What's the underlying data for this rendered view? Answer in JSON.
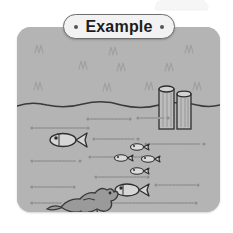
{
  "page": {
    "background_color": "#ffffff",
    "width": 233,
    "height": 233
  },
  "title_badge": {
    "label": "Example",
    "left_dot": "•",
    "right_dot": "•",
    "background_color": "#f2f2f2",
    "border_color": "#6e6e6e",
    "text_color": "#1c1c1c"
  },
  "scene": {
    "name": "underwater-ocean-illustration",
    "panel_color": "#b4b4b4",
    "line_color": "#4a4a4a",
    "sky": {
      "label": "sky-region",
      "bird_marks": [
        {
          "x": 18,
          "y": 18,
          "size": 8
        },
        {
          "x": 62,
          "y": 34,
          "size": 8
        },
        {
          "x": 17,
          "y": 55,
          "size": 9
        },
        {
          "x": 92,
          "y": 20,
          "size": 7
        },
        {
          "x": 100,
          "y": 36,
          "size": 8
        },
        {
          "x": 86,
          "y": 56,
          "size": 8
        },
        {
          "x": 128,
          "y": 55,
          "size": 8
        },
        {
          "x": 148,
          "y": 36,
          "size": 8
        },
        {
          "x": 168,
          "y": 18,
          "size": 8
        },
        {
          "x": 176,
          "y": 55,
          "size": 8
        }
      ]
    },
    "water_surface": {
      "label": "water-surface-line",
      "y": 77
    },
    "pilings": {
      "label": "wooden-pilings",
      "count": 2,
      "items": [
        {
          "x": 142,
          "y": 60,
          "width": 15,
          "height": 42
        },
        {
          "x": 160,
          "y": 64,
          "width": 14,
          "height": 36
        }
      ]
    },
    "currents": {
      "label": "underwater-current-lines",
      "items": [
        {
          "x1": 72,
          "y": 92,
          "x2": 112
        },
        {
          "x1": 122,
          "y": 91,
          "x2": 150
        },
        {
          "x1": 16,
          "y": 101,
          "x2": 70
        },
        {
          "x1": 78,
          "y": 112,
          "x2": 120
        },
        {
          "x1": 130,
          "y": 117,
          "x2": 186
        },
        {
          "x1": 16,
          "y": 134,
          "x2": 62
        },
        {
          "x1": 74,
          "y": 130,
          "x2": 124
        },
        {
          "x1": 80,
          "y": 150,
          "x2": 130
        },
        {
          "x1": 16,
          "y": 160,
          "x2": 56
        },
        {
          "x1": 140,
          "y": 158,
          "x2": 180
        },
        {
          "x1": 16,
          "y": 176,
          "x2": 48
        },
        {
          "x1": 86,
          "y": 176,
          "x2": 178
        }
      ]
    },
    "fish": {
      "label": "fish-group",
      "large_fish": [
        {
          "name": "fish-left-upper",
          "x": 45,
          "y": 113,
          "length": 26,
          "direction": "left"
        },
        {
          "name": "fish-bottom-center",
          "x": 110,
          "y": 163,
          "length": 24,
          "direction": "left"
        }
      ],
      "school": [
        {
          "name": "small-fish-1",
          "x": 120,
          "y": 120,
          "length": 13,
          "direction": "left"
        },
        {
          "name": "small-fish-2",
          "x": 104,
          "y": 130,
          "length": 13,
          "direction": "left"
        },
        {
          "name": "small-fish-3",
          "x": 130,
          "y": 132,
          "length": 13,
          "direction": "left"
        },
        {
          "name": "small-fish-4",
          "x": 120,
          "y": 143,
          "length": 13,
          "direction": "left"
        }
      ]
    },
    "creature": {
      "label": "sea-creature-bottom-left",
      "x": 60,
      "y": 158,
      "width": 42,
      "height": 30,
      "color": "#8e8e8e"
    }
  }
}
